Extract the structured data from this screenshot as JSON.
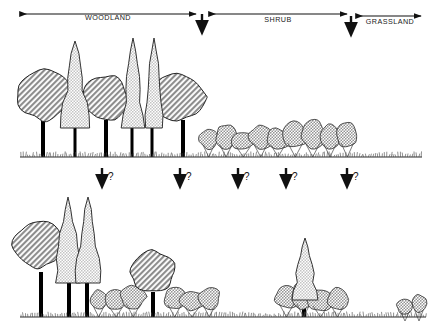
{
  "figure": {
    "background_color": "#ffffff",
    "line_color": "#111111",
    "canopy_broad_fill": "#9a9a9a",
    "canopy_conifer_fill": "#cfcfcf",
    "shrub_fill": "#a8a8a8",
    "trunk_color": "#000000",
    "ground_color": "#555555"
  },
  "zones": [
    {
      "id": "woodland",
      "label": "WOODLAND",
      "arrow_type": "double-headed",
      "x_start": 20,
      "x_end": 196,
      "label_x": 108,
      "label_y": 20,
      "axis_y": 14
    },
    {
      "id": "shrub",
      "label": "SHRUB",
      "arrow_type": "double-headed",
      "x_start": 209,
      "x_end": 347,
      "label_x": 278,
      "label_y": 22,
      "axis_y": 14
    },
    {
      "id": "grassland",
      "label": "GRASSLAND",
      "arrow_type": "double-headed",
      "x_start": 356,
      "x_end": 421,
      "label_x": 390,
      "label_y": 24,
      "axis_y": 16
    }
  ],
  "zone_boundary_arrows": [
    {
      "id": "boundary-woodland-shrub",
      "x": 202,
      "y_top": 14,
      "y_bottom": 38
    },
    {
      "id": "boundary-shrub-grassland",
      "x": 351,
      "y_top": 16,
      "y_bottom": 40
    }
  ],
  "transition_arrows": {
    "question_mark": "?",
    "items": [
      {
        "id": "transition-arrow-1",
        "x": 102,
        "y_top": 168,
        "y_bottom": 192,
        "label_x": 108,
        "label_y": 180
      },
      {
        "id": "transition-arrow-2",
        "x": 180,
        "y_top": 168,
        "y_bottom": 192,
        "label_x": 186,
        "label_y": 180
      },
      {
        "id": "transition-arrow-3",
        "x": 238,
        "y_top": 168,
        "y_bottom": 192,
        "label_x": 244,
        "label_y": 180
      },
      {
        "id": "transition-arrow-4",
        "x": 286,
        "y_top": 168,
        "y_bottom": 192,
        "label_x": 292,
        "label_y": 180
      },
      {
        "id": "transition-arrow-5",
        "x": 347,
        "y_top": 168,
        "y_bottom": 192,
        "label_x": 353,
        "label_y": 180
      }
    ]
  },
  "panels": [
    {
      "id": "panel-top",
      "name": "current-vegetation-profile",
      "ground_line": {
        "x_start": 20,
        "x_end": 422,
        "y": 157
      },
      "broad_trees": [
        {
          "id": "broad-tree-1",
          "cx": 44,
          "cy": 95,
          "rx": 29,
          "ry": 29,
          "trunk_x": 43,
          "trunk_top": 120,
          "trunk_bottom": 157,
          "trunk_w": 4
        },
        {
          "id": "broad-tree-2",
          "cx": 105,
          "cy": 98,
          "rx": 26,
          "ry": 26,
          "trunk_x": 106,
          "trunk_top": 120,
          "trunk_bottom": 157,
          "trunk_w": 4
        },
        {
          "id": "broad-tree-3",
          "cx": 177,
          "cy": 97,
          "rx": 28,
          "ry": 27,
          "trunk_x": 183,
          "trunk_top": 120,
          "trunk_bottom": 157,
          "trunk_w": 4
        }
      ],
      "conifer_trees": [
        {
          "id": "conifer-tree-1",
          "cx": 75,
          "apex_y": 41,
          "base_y": 128,
          "half_w": 13,
          "trunk_x": 75,
          "trunk_top": 126,
          "trunk_bottom": 157,
          "trunk_w": 3
        },
        {
          "id": "conifer-tree-2",
          "cx": 133,
          "apex_y": 38,
          "base_y": 128,
          "half_w": 10,
          "trunk_x": 132,
          "trunk_top": 126,
          "trunk_bottom": 157,
          "trunk_w": 3
        },
        {
          "id": "conifer-tree-3",
          "cx": 154,
          "apex_y": 38,
          "base_y": 128,
          "half_w": 10,
          "trunk_x": 152,
          "trunk_top": 126,
          "trunk_bottom": 157,
          "trunk_w": 3
        }
      ],
      "shrub_band": {
        "id": "shrub-band-top",
        "x_start": 200,
        "x_end": 356,
        "y_top": 126,
        "y_base": 152,
        "count": 9
      }
    },
    {
      "id": "panel-bottom",
      "name": "projected-vegetation-profile",
      "ground_line": {
        "x_start": 20,
        "x_end": 426,
        "y": 317
      },
      "broad_trees": [
        {
          "id": "broad-tree-b1",
          "cx": 38,
          "cy": 245,
          "rx": 27,
          "ry": 27,
          "trunk_x": 41,
          "trunk_top": 272,
          "trunk_bottom": 317,
          "trunk_w": 4
        },
        {
          "id": "broad-tree-b2",
          "cx": 152,
          "cy": 272,
          "rx": 24,
          "ry": 24,
          "trunk_x": 153,
          "trunk_top": 292,
          "trunk_bottom": 317,
          "trunk_w": 4
        }
      ],
      "conifer_trees": [
        {
          "id": "conifer-tree-b1",
          "cx": 68,
          "apex_y": 197,
          "base_y": 283,
          "half_w": 13,
          "trunk_x": 69,
          "trunk_top": 280,
          "trunk_bottom": 317,
          "trunk_w": 4
        },
        {
          "id": "conifer-tree-b2",
          "cx": 88,
          "apex_y": 197,
          "base_y": 283,
          "half_w": 12,
          "trunk_x": 87,
          "trunk_top": 280,
          "trunk_bottom": 317,
          "trunk_w": 4
        },
        {
          "id": "conifer-tree-b3",
          "cx": 305,
          "apex_y": 238,
          "base_y": 300,
          "half_w": 12,
          "trunk_x": 304,
          "trunk_top": 300,
          "trunk_bottom": 317,
          "trunk_w": 4
        }
      ],
      "shrub_groups": [
        {
          "id": "shrub-group-b1",
          "x_start": 90,
          "x_end": 142,
          "y_top": 287,
          "y_base": 312,
          "count": 3
        },
        {
          "id": "shrub-group-b2",
          "x_start": 166,
          "x_end": 218,
          "y_top": 287,
          "y_base": 312,
          "count": 3
        },
        {
          "id": "shrub-group-b3",
          "x_start": 278,
          "x_end": 346,
          "y_top": 286,
          "y_base": 312,
          "count": 4
        },
        {
          "id": "shrub-group-b4",
          "x_start": 398,
          "x_end": 426,
          "y_top": 298,
          "y_base": 316,
          "count": 2
        }
      ]
    }
  ]
}
